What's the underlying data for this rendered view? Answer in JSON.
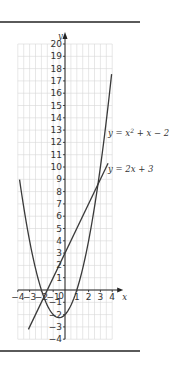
{
  "chart_data": {
    "type": "line",
    "title": "",
    "xlabel": "x",
    "ylabel": "y",
    "xlim": [
      -4,
      4
    ],
    "ylim": [
      -4,
      20
    ],
    "grid": true,
    "x_ticks": [
      "-4",
      "-3",
      "-2",
      "-1",
      "0",
      "1",
      "2",
      "3",
      "4"
    ],
    "y_ticks": [
      "-4",
      "-3",
      "-2",
      "-1",
      "1",
      "2",
      "3",
      "4",
      "5",
      "6",
      "7",
      "8",
      "9",
      "10",
      "11",
      "12",
      "13",
      "14",
      "15",
      "16",
      "17",
      "18",
      "19",
      "20"
    ],
    "series": [
      {
        "name": "y = x² + x − 2",
        "label_parts": {
          "lhs": "y = x",
          "sup": "2",
          "rhs": " + x − 2"
        },
        "equation": "y = x^2 + x - 2",
        "x_range": [
          -3.85,
          3.95
        ],
        "points": [
          [
            -3.85,
            9
          ],
          [
            -3,
            4
          ],
          [
            -2,
            0
          ],
          [
            -1,
            -2
          ],
          [
            -0.5,
            -2.25
          ],
          [
            0,
            -2
          ],
          [
            1,
            0
          ],
          [
            2,
            4
          ],
          [
            3,
            10
          ],
          [
            3.95,
            17.5
          ]
        ]
      },
      {
        "name": "y = 2x + 3",
        "equation": "y = 2x + 3",
        "x_range": [
          -3.1,
          3.65
        ],
        "points": [
          [
            -3.1,
            -3.2
          ],
          [
            3.65,
            10.3
          ]
        ]
      }
    ],
    "intersections": [
      [
        -1.62,
        -0.24
      ],
      [
        2.62,
        8.24
      ]
    ]
  },
  "labels": {
    "x_axis": "x",
    "y_axis": "y",
    "origin": "0",
    "curve1": "y = x² + x − 2",
    "curve2": "y = 2x + 3"
  }
}
